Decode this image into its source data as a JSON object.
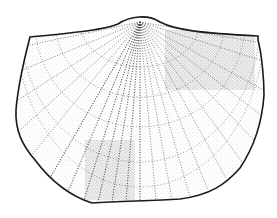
{
  "figure": {
    "subject": "brachiopod shell illustration",
    "style": "stippled line drawing",
    "colors": {
      "background": "#ffffff",
      "ink": "#1a1a1a",
      "stipple": "#333333"
    },
    "outline": "M30,37 C70,33 105,30 118,24 C130,16 148,14 160,22 C175,30 200,33 258,36 L258,40 C262,55 264,80 264,95 C262,125 252,150 240,168 C225,185 210,195 180,199 C150,201 120,201 92,203 C70,196 50,180 35,160 C22,145 15,130 16,110 C18,85 24,60 30,37 Z",
    "apex": [
      140,
      22
    ],
    "ribs": [
      [
        30,
        45
      ],
      [
        22,
        70
      ],
      [
        18,
        100
      ],
      [
        20,
        130
      ],
      [
        32,
        155
      ],
      [
        50,
        178
      ],
      [
        68,
        192
      ],
      [
        84,
        200
      ],
      [
        98,
        202
      ],
      [
        112,
        202
      ],
      [
        126,
        202
      ],
      [
        140,
        202
      ],
      [
        156,
        201
      ],
      [
        172,
        200
      ],
      [
        190,
        197
      ],
      [
        208,
        190
      ],
      [
        226,
        178
      ],
      [
        242,
        162
      ],
      [
        254,
        140
      ],
      [
        261,
        115
      ],
      [
        263,
        90
      ],
      [
        260,
        60
      ],
      [
        256,
        42
      ]
    ],
    "growth_lines": [
      {
        "rx": 60,
        "ry": 45
      },
      {
        "rx": 85,
        "ry": 75
      },
      {
        "rx": 105,
        "ry": 105
      },
      {
        "rx": 120,
        "ry": 140
      },
      {
        "rx": 125,
        "ry": 165
      }
    ],
    "dense_stipple_regions": [
      {
        "x": 165,
        "y": 30,
        "w": 90,
        "h": 60
      },
      {
        "x": 85,
        "y": 140,
        "w": 50,
        "h": 60
      }
    ]
  }
}
